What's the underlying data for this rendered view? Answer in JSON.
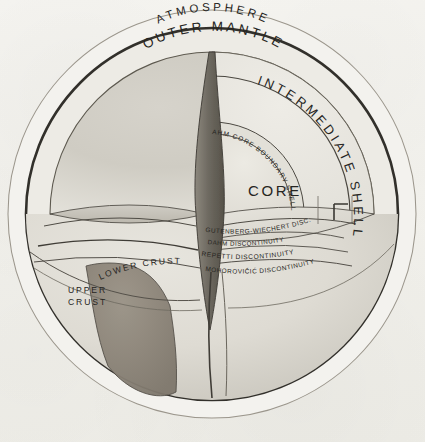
{
  "figure": {
    "medium": "pencil drawing on paper",
    "paper_color": "#f4f3ef",
    "ink_color": "#262522"
  },
  "labels": {
    "atmosphere": "ATMOSPHERE",
    "outer_mantle": "OUTER MANTLE",
    "intermediate_shell": "INTERMEDIATE SHELL",
    "core": "CORE",
    "dahm_core_boundary_shell": "DAHM CORE BOUNDARY SHELL",
    "gutenberg_wiechert": "GUTENBERG-WIECHERT DISC.",
    "dahm_discontinuity": "DAHM DISCONTINUITY",
    "repetti_discontinuity": "REPETTI DISCONTINUITY",
    "mohorovicic_discontinuity": "MOHOROVIČIĆ DISCONTINUITY",
    "lower_crust": "LOWER CRUST",
    "upper_crust": "UPPER CRUST"
  },
  "layers": [
    {
      "name": "ATMOSPHERE",
      "kind": "outer-ring",
      "fill": "#f2f1ec"
    },
    {
      "name": "OUTER MANTLE",
      "kind": "shell",
      "fill": "#e9e8e2"
    },
    {
      "name": "INTERMEDIATE SHELL",
      "kind": "shell",
      "fill": "#eceae4"
    },
    {
      "name": "DAHM CORE BOUNDARY SHELL",
      "kind": "thin-shell",
      "fill": "#e4e2db"
    },
    {
      "name": "CORE",
      "kind": "core",
      "fill": "#e6e4dd"
    },
    {
      "name": "LOWER CRUST",
      "kind": "crust",
      "fill": "#ddd9d0"
    },
    {
      "name": "UPPER CRUST",
      "kind": "crust",
      "fill": "#a39c90"
    }
  ],
  "boundaries": [
    {
      "name": "GUTENBERG-WIECHERT DISC."
    },
    {
      "name": "DAHM DISCONTINUITY"
    },
    {
      "name": "REPETTI DISCONTINUITY"
    },
    {
      "name": "MOHOROVIČIĆ DISCONTINUITY"
    }
  ]
}
